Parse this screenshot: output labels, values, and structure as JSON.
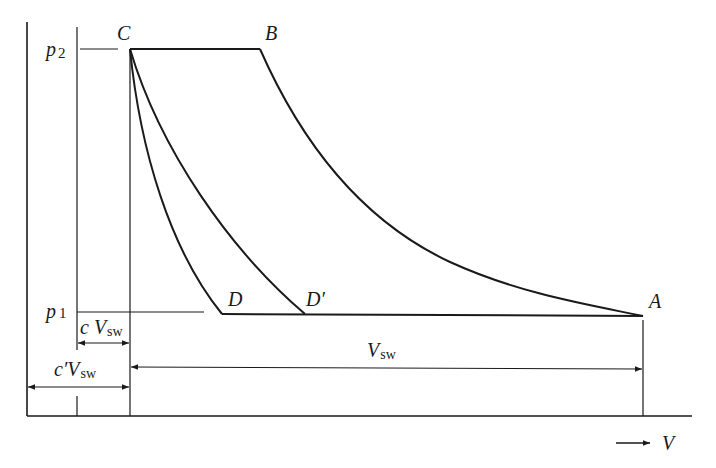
{
  "diagram": {
    "type": "p-V indicator diagram (reciprocating compressor)",
    "points": {
      "A": "A",
      "B": "B",
      "C": "C",
      "D": "D",
      "D_prime": "D′"
    },
    "pressure_labels": {
      "p2_main": "p",
      "p2_sub": "2",
      "p1_main": "p",
      "p1_sub": "1"
    },
    "dimensions": {
      "clearance_main": "c V",
      "clearance_sub": "sw",
      "clearance_prime_main": "c′V",
      "clearance_prime_sub": "sw",
      "swept_main": "V",
      "swept_sub": "sw"
    },
    "axis": {
      "x_label": "V",
      "x_arrow": "→"
    },
    "colors": {
      "line": "#1a1a1a",
      "background": "#ffffff"
    }
  }
}
